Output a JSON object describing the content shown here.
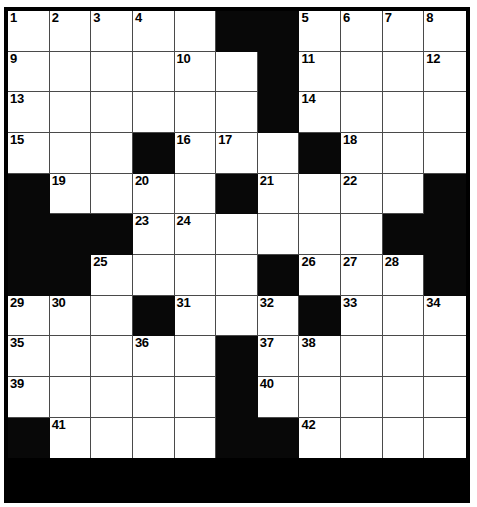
{
  "puzzle": {
    "type": "crossword-grid",
    "rows": 12,
    "cols": 11,
    "colors": {
      "background": "#ffffff",
      "block": "#080808",
      "cell_fill": "#ffffff",
      "grid_line": "#4a4a4a",
      "frame": "#000000",
      "number_color": "#000000"
    },
    "legend": {
      "white": "open letter cell",
      "black": "blocked cell"
    },
    "grid": [
      [
        "W1",
        "W2",
        "W3",
        "W4",
        "W",
        "B",
        "B",
        "W5",
        "W6",
        "W7",
        "W8"
      ],
      [
        "W9",
        "W",
        "W",
        "W",
        "W10",
        "W",
        "B",
        "W11",
        "W",
        "W",
        "W12"
      ],
      [
        "W13",
        "W",
        "W",
        "W",
        "W",
        "W",
        "B",
        "W14",
        "W",
        "W",
        "W"
      ],
      [
        "W15",
        "W",
        "W",
        "B",
        "W16",
        "W17",
        "W",
        "B",
        "W18",
        "W",
        "W"
      ],
      [
        "B",
        "W19",
        "W",
        "W20",
        "W",
        "B",
        "W21",
        "W",
        "W22",
        "W",
        "B"
      ],
      [
        "B",
        "B",
        "B",
        "W23",
        "W24",
        "W",
        "W",
        "W",
        "W",
        "B",
        "B"
      ],
      [
        "B",
        "B",
        "W25",
        "W",
        "W",
        "W",
        "B",
        "W26",
        "W27",
        "W28",
        "B"
      ],
      [
        "W29",
        "W30",
        "W",
        "B",
        "W31",
        "W",
        "W32",
        "B",
        "W33",
        "W",
        "W34"
      ],
      [
        "W35",
        "W",
        "W",
        "W36",
        "W",
        "B",
        "W37",
        "W38",
        "W",
        "W",
        "W"
      ],
      [
        "W39",
        "W",
        "W",
        "W",
        "W",
        "B",
        "W40",
        "W",
        "W",
        "W",
        "W"
      ],
      [
        "B",
        "W41",
        "W",
        "W",
        "W",
        "B",
        "B",
        "W42",
        "W",
        "W",
        "W"
      ]
    ],
    "grid_note": "row index 0 is top; 'B' = black block, 'W' = white cell, 'W<n>' = white cell carrying clue number n",
    "numbers": [
      1,
      2,
      3,
      4,
      5,
      6,
      7,
      8,
      9,
      10,
      11,
      12,
      13,
      14,
      15,
      16,
      17,
      18,
      19,
      20,
      21,
      22,
      23,
      24,
      25,
      26,
      27,
      28,
      29,
      30,
      31,
      32,
      33,
      34,
      35,
      36,
      37,
      38,
      39,
      40,
      41,
      42
    ],
    "number_count": 42
  }
}
